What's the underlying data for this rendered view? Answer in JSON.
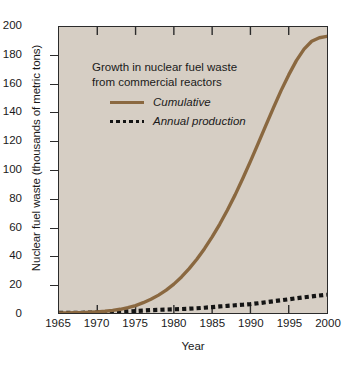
{
  "chart_data": {
    "type": "line",
    "title": "Growth in nuclear fuel waste from commercial reactors",
    "title_line1": "Growth in nuclear fuel waste",
    "title_line2": "from commercial reactors",
    "xlabel": "Year",
    "ylabel": "Nuclear fuel waste (thousands of metric tons)",
    "xlim": [
      1965,
      2000
    ],
    "ylim": [
      0,
      200
    ],
    "xticks": [
      1965,
      1970,
      1975,
      1980,
      1985,
      1990,
      1995,
      2000
    ],
    "yticks": [
      0,
      20,
      40,
      60,
      80,
      100,
      120,
      140,
      160,
      180,
      200
    ],
    "grid": false,
    "legend_position": "upper-left-inside",
    "plot_background": "#d6cec4",
    "x": [
      1965,
      1966,
      1967,
      1968,
      1969,
      1970,
      1971,
      1972,
      1973,
      1974,
      1975,
      1976,
      1977,
      1978,
      1979,
      1980,
      1981,
      1982,
      1983,
      1984,
      1985,
      1986,
      1987,
      1988,
      1989,
      1990,
      1991,
      1992,
      1993,
      1994,
      1995,
      1996,
      1997,
      1998,
      1999,
      2000
    ],
    "series": [
      {
        "name": "Cumulative",
        "color": "#8a6840",
        "style": "solid",
        "values": [
          0,
          0.1,
          0.2,
          0.3,
          0.5,
          0.8,
          1.2,
          1.8,
          2.6,
          3.7,
          5.2,
          7.2,
          9.6,
          12.5,
          16.0,
          20.2,
          25.2,
          31.0,
          37.6,
          45.0,
          53.2,
          62.2,
          72.0,
          82.6,
          94.0,
          106.0,
          118.5,
          131.0,
          143.5,
          155.5,
          166.5,
          176.5,
          184.5,
          190.0,
          192.5,
          193.5
        ]
      },
      {
        "name": "Annual production",
        "color": "#141414",
        "style": "dotted",
        "values": [
          0.1,
          0.1,
          0.1,
          0.2,
          0.3,
          0.4,
          0.5,
          0.7,
          0.9,
          1.1,
          1.4,
          1.7,
          2.0,
          2.2,
          2.4,
          2.6,
          2.8,
          3.0,
          3.3,
          3.7,
          4.1,
          4.6,
          5.0,
          5.4,
          5.8,
          6.2,
          6.8,
          7.5,
          8.2,
          8.9,
          9.6,
          10.3,
          11.0,
          11.6,
          12.2,
          12.8
        ]
      }
    ]
  }
}
